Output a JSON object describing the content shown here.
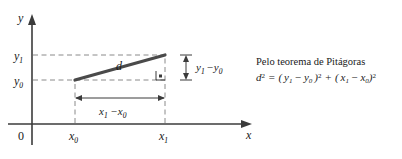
{
  "figure": {
    "title_hidden": "Distance between two points derivation diagram",
    "axes": {
      "x_axis_label": "x",
      "y_axis_label": "y",
      "origin_label": "0"
    },
    "tick_labels": {
      "x0": "x",
      "x0_sub": "0",
      "x1": "x",
      "x1_sub": "1",
      "y0": "y",
      "y0_sub": "0",
      "y1": "y",
      "y1_sub": "1"
    },
    "segments": {
      "hypotenuse_label": "d",
      "vertical_measure_label_parts": {
        "var1": "y",
        "sub1": "1",
        "minus": "−",
        "var2": "y",
        "sub2": "0"
      },
      "horizontal_measure_label_parts": {
        "var1": "x",
        "sub1": "1",
        "minus": "−",
        "var2": "x",
        "sub2": "0"
      }
    },
    "caption": {
      "title": "Pelo teorema de Pitágoras",
      "formula_plain": "d² = ( y₁ − y₀ )² + ( x₁ − x₀ )²",
      "formula_parts": {
        "d": "d",
        "d_sup": "2",
        "equals": "=",
        "open1": "(",
        "y1": "y",
        "y1_sub": "1",
        "minus1": "−",
        "y0": "y",
        "y0_sub": "0",
        "close1": ")",
        "close1_sup": "2",
        "plus": "+",
        "open2": "(",
        "x1": "x",
        "x1_sub": "1",
        "minus2": "−",
        "x0": "x",
        "x0_sub": "0",
        "close2": ")",
        "close2_sup": "2"
      }
    },
    "colors": {
      "background": "#ffffff",
      "axis": "#3b3b3b",
      "guide_dashed": "#8a8a8a",
      "hypotenuse": "#4a4a4a",
      "text": "#1a1a1a"
    },
    "geometry": {
      "y_axis_x": 32,
      "x_axis_y": 124,
      "x0": 75,
      "x1": 165,
      "y0": 80,
      "y1": 55
    }
  }
}
